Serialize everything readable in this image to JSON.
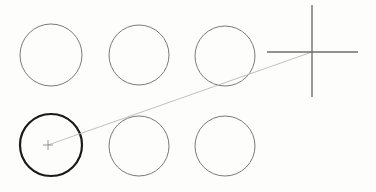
{
  "canvas": {
    "width": 376,
    "height": 192,
    "background_color": "#fdfdfc",
    "description": "Technical sketch: two rows of three circles with a large crosshair at right and a faint leader line connecting a small cross marker to the crosshair center"
  },
  "style": {
    "thin_circle_color": "#7a7a7a",
    "thin_circle_width": 1,
    "selected_circle_color": "#1a1a1a",
    "selected_circle_width": 2.2,
    "crosshair_color": "#6e6e6e",
    "crosshair_width": 1.4,
    "leader_line_color": "#b9b9b9",
    "leader_line_width": 0.9,
    "marker_cross_color": "#8a8a8a",
    "marker_cross_width": 0.9
  },
  "shapes": {
    "circles": [
      {
        "id": "circle-top-1",
        "label": "Circle top row 1",
        "cx": 51,
        "cy": 55,
        "r": 31,
        "state": "normal"
      },
      {
        "id": "circle-top-2",
        "label": "Circle top row 2",
        "cx": 139,
        "cy": 55,
        "r": 30,
        "state": "normal"
      },
      {
        "id": "circle-top-3",
        "label": "Circle top row 3",
        "cx": 225,
        "cy": 56,
        "r": 30,
        "state": "normal"
      },
      {
        "id": "circle-bottom-1",
        "label": "Circle bottom row 1",
        "cx": 51,
        "cy": 145,
        "r": 31,
        "state": "selected"
      },
      {
        "id": "circle-bottom-2",
        "label": "Circle bottom row 2",
        "cx": 139,
        "cy": 146,
        "r": 30,
        "state": "normal"
      },
      {
        "id": "circle-bottom-3",
        "label": "Circle bottom row 3",
        "cx": 225,
        "cy": 146,
        "r": 30,
        "state": "normal"
      }
    ],
    "crosshair": {
      "id": "crosshair-large",
      "label": "Large crosshair target",
      "cx": 312,
      "cy": 52,
      "horizontal_start_x": 267,
      "horizontal_end_x": 358,
      "vertical_start_y": 5,
      "vertical_end_y": 97
    },
    "marker_cross": {
      "id": "marker-cross-small",
      "label": "Small center cross marker",
      "cx": 48,
      "cy": 145,
      "arm": 5
    },
    "leader_line": {
      "id": "leader-line",
      "label": "Leader line from marker to crosshair",
      "x1": 48,
      "y1": 145,
      "x2": 312,
      "y2": 52
    }
  }
}
